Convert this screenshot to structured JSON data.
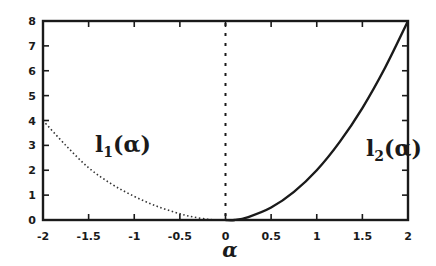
{
  "chart_data": {
    "type": "line",
    "title": "",
    "xlabel": "α",
    "ylabel": "",
    "xlim": [
      -2,
      2
    ],
    "ylim": [
      0,
      8
    ],
    "grid": false,
    "xticks": [
      "-2",
      "-1.5",
      "-1",
      "-0.5",
      "0",
      "0.5",
      "1",
      "1.5",
      "2"
    ],
    "xtick_values": [
      -2,
      -1.5,
      -1,
      -0.5,
      0,
      0.5,
      1,
      1.5,
      2
    ],
    "yticks": [
      "0",
      "1",
      "2",
      "3",
      "4",
      "5",
      "6",
      "7",
      "8"
    ],
    "ytick_values": [
      0,
      1,
      2,
      3,
      4,
      5,
      6,
      7,
      8
    ],
    "series": [
      {
        "name": "l1(α)",
        "label_main": "l",
        "label_sub": "1",
        "label_arg": "(α)",
        "style": "dotted",
        "x": [
          -2,
          -1.75,
          -1.5,
          -1.25,
          -1,
          -0.75,
          -0.5,
          -0.35,
          -0.2,
          -0.1,
          0
        ],
        "y": [
          4,
          3.0,
          2.1,
          1.45,
          0.95,
          0.55,
          0.25,
          0.12,
          0.03,
          0,
          0
        ]
      },
      {
        "name": "l2(α)",
        "label_main": "l",
        "label_sub": "2",
        "label_arg": "(α)",
        "style": "solid",
        "x": [
          0,
          0.1,
          0.25,
          0.5,
          0.75,
          1,
          1.25,
          1.5,
          1.75,
          2
        ],
        "y": [
          0,
          0,
          0.12,
          0.5,
          1.13,
          2.0,
          3.13,
          4.5,
          6.13,
          8
        ]
      }
    ],
    "annotations": [
      {
        "type": "vline",
        "x": 0,
        "style": "dashed"
      }
    ]
  },
  "colors": {
    "ink": "#1a1a1a",
    "background": "#ffffff"
  }
}
